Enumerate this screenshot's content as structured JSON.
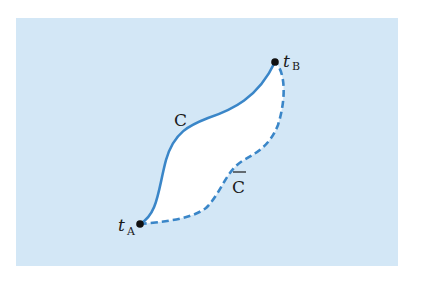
{
  "diagram": {
    "background_color": "#d3e7f6",
    "curve_color": "#3a86c8",
    "labels": {
      "curve_solid": "C",
      "curve_dashed": "C",
      "point_a": "t",
      "point_a_sub": "A",
      "point_b": "t",
      "point_b_sub": "B"
    },
    "points": {
      "A": {
        "x": 140,
        "y": 224
      },
      "B": {
        "x": 275,
        "y": 62
      }
    }
  }
}
